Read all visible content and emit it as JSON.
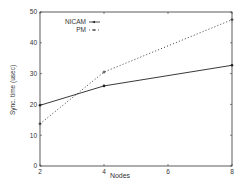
{
  "chart_data": {
    "type": "line",
    "title": "",
    "xlabel": "Nodes",
    "ylabel": "Sync. time (usec)",
    "x": [
      2,
      4,
      8
    ],
    "xlim": [
      2,
      8
    ],
    "ylim": [
      0,
      50
    ],
    "xticks": [
      2,
      4,
      6,
      8
    ],
    "yticks": [
      0,
      10,
      20,
      30,
      40,
      50
    ],
    "grid": false,
    "legend_position": "upper-left",
    "series": [
      {
        "name": "NICAM",
        "style": "solid",
        "values": [
          19.7,
          26.0,
          32.7
        ]
      },
      {
        "name": "PM",
        "style": "dotted",
        "values": [
          13.7,
          30.5,
          47.5
        ]
      }
    ]
  },
  "legend": {
    "nicam": "NICAM",
    "pm": "PM"
  },
  "axes": {
    "xlabel": "Nodes",
    "ylabel": "Sync. time (usec)",
    "xtick_labels": [
      "2",
      "4",
      "6",
      "8"
    ],
    "ytick_labels": [
      "0",
      "10",
      "20",
      "30",
      "40",
      "50"
    ]
  }
}
